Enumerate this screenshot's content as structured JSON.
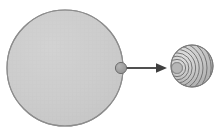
{
  "figure": {
    "width": 224,
    "height": 136,
    "background_color": "#ffffff"
  },
  "colors": {
    "body_fill": "#cccccc",
    "body_fill_light": "#d8d8d8",
    "body_fill_dark": "#bdbdbd",
    "body_stroke": "#888888",
    "marker_fill": "#9a9a9a",
    "marker_stroke": "#6e6e6e",
    "arrow_color": "#4a4a4a",
    "wave_stroke": "#6b6b6b",
    "small_body_fill": "#c2c2c2",
    "small_body_highlight": "#e0e0e0",
    "small_body_shadow": "#9e9e9e",
    "core_fill": "#b0b0b0"
  },
  "shapes": {
    "large_body": {
      "label": "large-sphere",
      "cx": 65,
      "cy": 68,
      "r": 58,
      "fill": "#cccccc",
      "stroke": "#8a8a8a",
      "stroke_width": 1
    },
    "emission_marker": {
      "label": "emission-point",
      "cx": 121,
      "cy": 68,
      "r": 5.5,
      "fill": "#9a9a9a",
      "stroke": "#6e6e6e"
    },
    "arrow": {
      "label": "direction-arrow",
      "x1": 126,
      "y1": 68,
      "x2": 164,
      "y2": 68,
      "head_length": 9,
      "head_half_width": 4.5,
      "color": "#474747",
      "stroke_width": 2
    },
    "small_body": {
      "label": "small-sphere",
      "cx": 192,
      "cy": 66,
      "r": 21,
      "fill": "#c4c4c4",
      "stroke": "#7d7d7d"
    },
    "small_core": {
      "label": "small-sphere-core",
      "cx": 177,
      "cy": 68,
      "r": 5.5,
      "fill": "#b3b3b3",
      "stroke": "#8d8d8d"
    },
    "wavefronts": {
      "label": "concentric-wavefronts",
      "origin_x": 177,
      "origin_y": 68,
      "count": 8,
      "radii": [
        5.5,
        8.5,
        11.5,
        14.5,
        18,
        21.5,
        25,
        28.5,
        32
      ],
      "stroke": "#6b6b6b",
      "stroke_width": 0.9
    }
  },
  "annotations": {
    "captions": []
  }
}
